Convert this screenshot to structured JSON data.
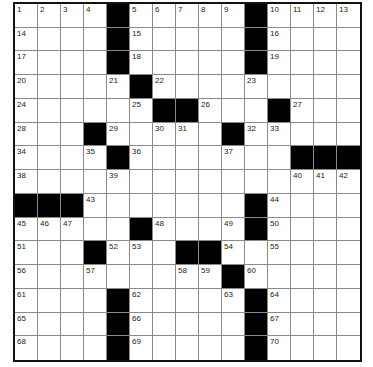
{
  "puzzle": {
    "rows": 15,
    "cols": 15,
    "colors": {
      "block": "#000000",
      "cell": "#ffffff",
      "gridline": "#8a8a8a",
      "border": "#111111"
    },
    "grid": [
      [
        "1",
        "2",
        "3",
        "4",
        "#",
        "5",
        "6",
        "7",
        "8",
        "9",
        "#",
        "10",
        "11",
        "12",
        "13"
      ],
      [
        "14",
        ".",
        ".",
        ".",
        "#",
        "15",
        ".",
        ".",
        ".",
        ".",
        "#",
        "16",
        ".",
        ".",
        "."
      ],
      [
        "17",
        ".",
        ".",
        ".",
        "#",
        "18",
        ".",
        ".",
        ".",
        ".",
        "#",
        "19",
        ".",
        ".",
        "."
      ],
      [
        "20",
        ".",
        ".",
        ".",
        "21",
        "#",
        "22",
        ".",
        ".",
        ".",
        "23",
        ".",
        ".",
        ".",
        "."
      ],
      [
        "24",
        ".",
        ".",
        ".",
        ".",
        "25",
        "#",
        "#",
        "26",
        ".",
        ".",
        "#",
        "27",
        ".",
        "."
      ],
      [
        "28",
        ".",
        ".",
        "#",
        "29",
        ".",
        "30",
        "31",
        ".",
        "#",
        "32",
        "33",
        ".",
        ".",
        "."
      ],
      [
        "34",
        ".",
        ".",
        "35",
        "#",
        "36",
        ".",
        ".",
        ".",
        "37",
        ".",
        ".",
        "#",
        "#",
        "#"
      ],
      [
        "38",
        ".",
        ".",
        ".",
        "39",
        ".",
        ".",
        ".",
        ".",
        ".",
        ".",
        ".",
        "40",
        "41",
        "42"
      ],
      [
        "#",
        "#",
        "#",
        "43",
        ".",
        ".",
        ".",
        ".",
        ".",
        ".",
        "#",
        "44",
        ".",
        ".",
        "."
      ],
      [
        "45",
        "46",
        "47",
        ".",
        ".",
        "#",
        "48",
        ".",
        ".",
        "49",
        "#",
        "50",
        ".",
        ".",
        "."
      ],
      [
        "51",
        ".",
        ".",
        "#",
        "52",
        "53",
        ".",
        "#",
        "#",
        "54",
        ".",
        "55",
        ".",
        ".",
        "."
      ],
      [
        "56",
        ".",
        ".",
        "57",
        ".",
        ".",
        ".",
        "58",
        "59",
        "#",
        "60",
        ".",
        ".",
        ".",
        "."
      ],
      [
        "61",
        ".",
        ".",
        ".",
        "#",
        "62",
        ".",
        ".",
        ".",
        "63",
        "#",
        "64",
        ".",
        ".",
        "."
      ],
      [
        "65",
        ".",
        ".",
        ".",
        "#",
        "66",
        ".",
        ".",
        ".",
        ".",
        "#",
        "67",
        ".",
        ".",
        "."
      ],
      [
        "68",
        ".",
        ".",
        ".",
        "#",
        "69",
        ".",
        ".",
        ".",
        ".",
        "#",
        "70",
        ".",
        ".",
        "."
      ]
    ]
  }
}
